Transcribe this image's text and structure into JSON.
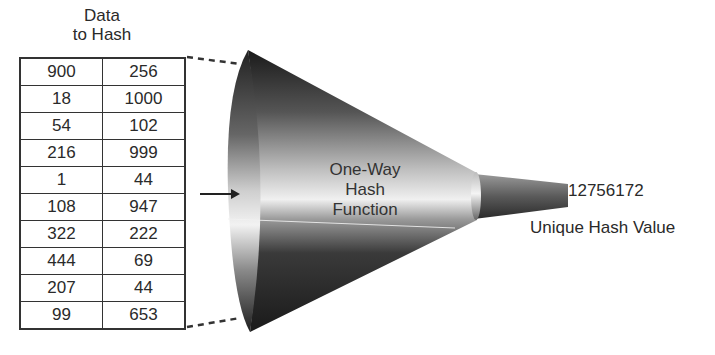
{
  "input": {
    "title_line1": "Data",
    "title_line2": "to Hash",
    "rows": [
      [
        "900",
        "256"
      ],
      [
        "18",
        "1000"
      ],
      [
        "54",
        "102"
      ],
      [
        "216",
        "999"
      ],
      [
        "1",
        "44"
      ],
      [
        "108",
        "947"
      ],
      [
        "322",
        "222"
      ],
      [
        "444",
        "69"
      ],
      [
        "207",
        "44"
      ],
      [
        "99",
        "653"
      ]
    ]
  },
  "funnel": {
    "label_line1": "One-Way",
    "label_line2": "Hash",
    "label_line3": "Function"
  },
  "output": {
    "hash_value": "12756172",
    "caption": "Unique Hash Value"
  },
  "colors": {
    "line": "#333333",
    "funnel_dark": "#1e1e1e",
    "funnel_light": "#e8e8e8"
  }
}
